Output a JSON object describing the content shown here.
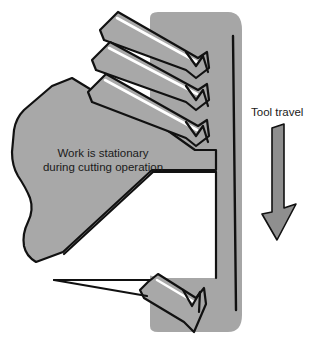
{
  "figure": {
    "name": "broaching-operation-diagram",
    "background_color": "#ffffff"
  },
  "labels": {
    "tool_travel": "Tool travel",
    "work_note_line1": "Work is stationary",
    "work_note_line2": "during cutting operation"
  },
  "colors": {
    "metal_gray": "#a8a8a8",
    "tool_gray": "#a6a6a6",
    "arrow_gray": "#8f8f8f",
    "outline": "#111111",
    "highlight": "#ffffff",
    "cut_slot": "#ffffff",
    "text": "#1a1a1a"
  },
  "parts": {
    "workpiece": "stationary work block with wavy break edge on left",
    "broach_tool": "vertical broach shank with angled cutting teeth",
    "tooth_count_upper": 3,
    "tooth_count_lower": 1,
    "cut_slot": "white machined groove in workpiece",
    "direction_arrow": "downward arrow indicating tool travel"
  }
}
